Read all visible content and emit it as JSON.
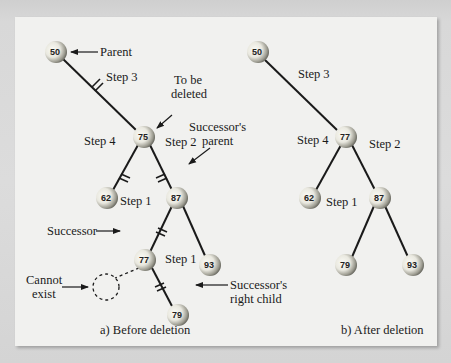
{
  "figure": {
    "panel_a": {
      "caption": "a) Before deletion",
      "nodes": [
        {
          "key": "50",
          "x": 56,
          "y": 52
        },
        {
          "key": "75",
          "x": 144,
          "y": 137
        },
        {
          "key": "62",
          "x": 107,
          "y": 198
        },
        {
          "key": "87",
          "x": 177,
          "y": 198
        },
        {
          "key": "77",
          "x": 145,
          "y": 260
        },
        {
          "key": "93",
          "x": 210,
          "y": 265
        },
        {
          "key": "79",
          "x": 178,
          "y": 315
        }
      ],
      "annotations": {
        "parent": "Parent",
        "to_be_deleted_1": "To be",
        "to_be_deleted_2": "deleted",
        "successors_parent_1": "Successor's",
        "successors_parent_2": "parent",
        "successor": "Successor",
        "cannot_exist_1": "Cannot",
        "cannot_exist_2": "exist",
        "successors_right_child_1": "Successor's",
        "successors_right_child_2": "right child"
      },
      "steps": {
        "step3": "Step 3",
        "step4": "Step 4",
        "step2": "Step 2",
        "step1a": "Step 1",
        "step1b": "Step 1"
      }
    },
    "panel_b": {
      "caption": "b) After deletion",
      "nodes": [
        {
          "key": "50",
          "x": 258,
          "y": 52
        },
        {
          "key": "77",
          "x": 346,
          "y": 137
        },
        {
          "key": "62",
          "x": 310,
          "y": 198
        },
        {
          "key": "87",
          "x": 380,
          "y": 198
        },
        {
          "key": "79",
          "x": 346,
          "y": 265
        },
        {
          "key": "93",
          "x": 413,
          "y": 265
        }
      ],
      "steps": {
        "step3": "Step 3",
        "step4": "Step 4",
        "step2": "Step 2",
        "step1": "Step 1"
      }
    },
    "colors": {
      "panel_bg": "#f1f1ef",
      "edge": "#1a1a1a",
      "node_light": "#f7f7f2",
      "node_dark": "#5a5a50"
    }
  }
}
